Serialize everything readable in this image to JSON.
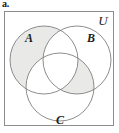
{
  "figure": {
    "part_label": "a.",
    "type": "venn-diagram-three-sets",
    "universe_label": "U",
    "border_color": "#8d8d8d",
    "background_color": "#ffffff",
    "circle_stroke_color": "#777777",
    "shade_color": "#e9e9e7",
    "sets": [
      {
        "id": "A",
        "label": "A",
        "label_x": 24,
        "label_y": 30,
        "cx": 39,
        "cy": 48,
        "r": 34
      },
      {
        "id": "B",
        "label": "B",
        "label_x": 85,
        "label_y": 30,
        "cx": 72,
        "cy": 48,
        "r": 34
      },
      {
        "id": "C",
        "label": "C",
        "label_x": 54,
        "label_y": 111,
        "cx": 55,
        "cy": 75,
        "r": 34
      }
    ],
    "shaded_regions": [
      {
        "name": "A-only",
        "description": "A minus B minus C"
      },
      {
        "name": "B-and-C-not-A",
        "description": "B intersect C minus A"
      }
    ]
  }
}
